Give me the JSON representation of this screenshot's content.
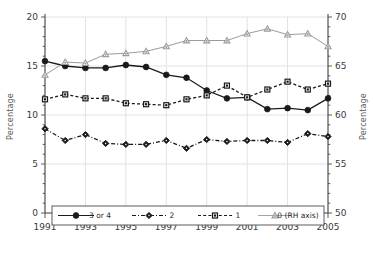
{
  "chart_data": {
    "type": "line",
    "title": "",
    "xlabel": "",
    "ylabel": "Percentage",
    "ylabel_right": "Percentage",
    "x": [
      1991,
      1992,
      1993,
      1994,
      1995,
      1996,
      1997,
      1998,
      1999,
      2000,
      2001,
      2002,
      2003,
      2004,
      2005
    ],
    "xtick_labels": [
      "1991",
      "1993",
      "1995",
      "1997",
      "1999",
      "2001",
      "2003",
      "2005"
    ],
    "xticks": [
      1991,
      1993,
      1995,
      1997,
      1999,
      2001,
      2003,
      2005
    ],
    "ylim": [
      0,
      20
    ],
    "ytick_labels": [
      "0",
      "5",
      "10",
      "15",
      "20"
    ],
    "yticks": [
      0,
      5,
      10,
      15,
      20
    ],
    "ylim_right": [
      50,
      70
    ],
    "ytick_labels_right": [
      "50",
      "55",
      "60",
      "65",
      "70"
    ],
    "yticks_right": [
      50,
      55,
      60,
      65,
      70
    ],
    "grid": true,
    "legend_position": "bottom",
    "series": [
      {
        "name": "3 or 4",
        "axis": "left",
        "marker": "filled-circle",
        "line": "solid",
        "color": "#1a1a1a",
        "values": [
          15.5,
          15.0,
          14.8,
          14.8,
          15.1,
          14.9,
          14.1,
          13.8,
          12.5,
          11.7,
          11.8,
          10.6,
          10.7,
          10.5,
          11.7
        ]
      },
      {
        "name": "2",
        "axis": "left",
        "marker": "open-diamond",
        "line": "dash-dot",
        "color": "#1a1a1a",
        "values": [
          8.6,
          7.4,
          8.0,
          7.1,
          7.0,
          7.0,
          7.4,
          6.6,
          7.5,
          7.3,
          7.4,
          7.4,
          7.2,
          8.1,
          7.8
        ]
      },
      {
        "name": "1",
        "axis": "left",
        "marker": "filled-square",
        "line": "dashed",
        "color": "#1a1a1a",
        "values": [
          11.6,
          12.1,
          11.7,
          11.7,
          11.2,
          11.1,
          11.0,
          11.6,
          12.0,
          13.0,
          11.8,
          12.6,
          13.4,
          12.6,
          13.2
        ]
      },
      {
        "name": "0 (RH axis)",
        "axis": "right",
        "marker": "open-triangle",
        "line": "solid",
        "color": "#9b9b9b",
        "values": [
          64.1,
          65.4,
          65.3,
          66.2,
          66.3,
          66.5,
          67.0,
          67.6,
          67.6,
          67.6,
          68.3,
          68.8,
          68.2,
          68.3,
          67.0
        ]
      }
    ]
  },
  "legend": {
    "items": [
      {
        "label": "3 or 4"
      },
      {
        "label": "2"
      },
      {
        "label": "1"
      },
      {
        "label": "0 (RH axis)"
      }
    ]
  },
  "axes": {
    "left_title": "Percentage",
    "right_title": "Percentage"
  }
}
